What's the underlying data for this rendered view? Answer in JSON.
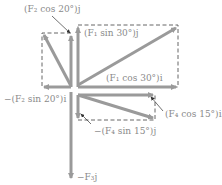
{
  "diagram": {
    "type": "force-vector-components",
    "colors": {
      "arrow": "#9a9a9a",
      "dashed": "#555555",
      "label": "#8a8a8a",
      "background": "#ffffff"
    },
    "labels": {
      "f2_cos": "(F₂ cos 20°)j",
      "f1_sin": "(F₁ sin 30°)j",
      "f1_cos": "(F₁ cos 30°)i",
      "f2_sin": "−(F₂ sin 20°)i",
      "f4_cos": "(F₄ cos 15°)i",
      "f4_sin": "−(F₄ sin 15°)j",
      "f3": "−F₃j"
    }
  }
}
